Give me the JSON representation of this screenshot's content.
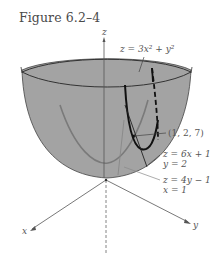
{
  "figure": {
    "title": "Figure 6.2–4",
    "surface_label": "z = 3x² + y²",
    "point_label": "(1, 2, 7)",
    "trace1_label_line1": "z = 6x + 1",
    "trace1_label_line2": "y = 2",
    "trace2_label_line1": "z = 4y − 1",
    "trace2_label_line2": "x = 1",
    "axis_x": "x",
    "axis_y": "y",
    "axis_z": "z",
    "colors": {
      "surface_fill": "#a3a3a3",
      "rim": "#333333",
      "curve_dark": "#111111",
      "curve_gray": "#7a7a7a",
      "axes": "#555555",
      "text": "#555555"
    }
  }
}
